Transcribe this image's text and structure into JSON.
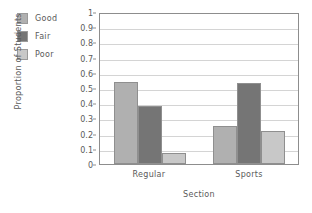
{
  "chart_data": {
    "type": "bar",
    "title": "",
    "xlabel": "Section",
    "ylabel": "Proportion of Students",
    "categories": [
      "Regular",
      "Sports"
    ],
    "series": [
      {
        "name": "Good",
        "values": [
          0.54,
          0.25
        ],
        "color": "#b0b0b0"
      },
      {
        "name": "Fair",
        "values": [
          0.38,
          0.53
        ],
        "color": "#757575"
      },
      {
        "name": "Poor",
        "values": [
          0.07,
          0.22
        ],
        "color": "#c8c8c8"
      }
    ],
    "ylim": [
      0,
      1
    ],
    "y_ticks": [
      "0",
      "0.1",
      "0.2",
      "0.3",
      "0.4",
      "0.5",
      "0.6",
      "0.7",
      "0.8",
      "0.9",
      "1"
    ],
    "grid": true,
    "legend_position": "upper-left-outside",
    "axis_color": "#8d8d8d",
    "grid_color": "#d4d4d4"
  },
  "legend": {
    "items": [
      {
        "label": "Good",
        "color": "#b0b0b0"
      },
      {
        "label": "Fair",
        "color": "#757575"
      },
      {
        "label": "Poor",
        "color": "#c8c8c8"
      }
    ]
  }
}
